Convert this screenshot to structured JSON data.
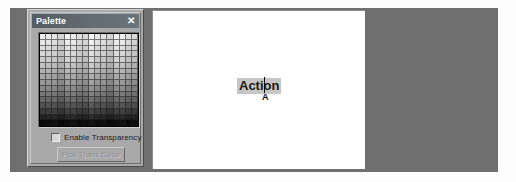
{
  "palette_window": {
    "title": "Palette",
    "close_label": "✕",
    "transparency": {
      "label": "Enable Transparency",
      "checked": false
    },
    "pick_trans_color_label": "Pick Trans Color",
    "grid": {
      "columns": 16,
      "rows": 16,
      "description": "grayscale swatch grid, light to dark",
      "ramp": [
        "#f2f2f2",
        "#ececec",
        "#e4e4e4",
        "#dcdcdc",
        "#d2d2d2",
        "#c6c6c6",
        "#b9b9b9",
        "#ababab",
        "#9c9c9c",
        "#8d8d8d",
        "#7d7d7d",
        "#6b6b6b",
        "#565656",
        "#3f3f3f",
        "#272727",
        "#0d0d0d"
      ]
    }
  },
  "canvas": {
    "text_object": {
      "text": "Action",
      "caret_mark": "A",
      "cursor_after_chars": 4
    }
  },
  "colors": {
    "desktop": "#6f6f6f",
    "canvas": "#ffffff",
    "window_face": "#a9a9a9",
    "titlebar": "#646c74",
    "selection_highlight": "#c6c6c6",
    "disabled_text": "#8e8e8e"
  }
}
